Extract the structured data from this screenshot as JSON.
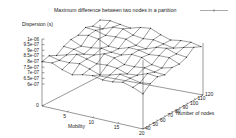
{
  "chart_data": {
    "type": "surface3d",
    "title": "",
    "legend": [
      {
        "label": "Maximum difference between two nodes in a partition",
        "style": "line-with-points",
        "color": "#000000"
      }
    ],
    "zlabel": "Dispersion (s)",
    "xlabel": "Mobility",
    "ylabel": "Number of nodes",
    "x_ticks": [
      "0",
      "5",
      "10",
      "15",
      "20"
    ],
    "y_ticks": [
      "40",
      "50",
      "60",
      "70",
      "80",
      "90",
      "100",
      "110",
      "120"
    ],
    "z_ticks": [
      "1e-06",
      "9.5e-07",
      "9e-07",
      "8.5e-07",
      "8e-07",
      "7.5e-07",
      "7e-07",
      "6.5e-07",
      "6e-07"
    ],
    "xlim": [
      0,
      20
    ],
    "ylim": [
      40,
      120
    ],
    "zlim": [
      6e-07,
      1e-06
    ],
    "grid": false,
    "legend_position": "top-right",
    "surface_description": "Wireframe mesh roughly flat between ~8.5e-07 and ~9.5e-07 across all mobility (0-20) and node counts (40-120), with small fluctuations",
    "z_values_approx": [
      [
        8.6e-07,
        8.8e-07,
        8.9e-07,
        9e-07,
        9.1e-07,
        9.2e-07,
        9.3e-07,
        9.3e-07,
        9.4e-07
      ],
      [
        8.7e-07,
        8.8e-07,
        8.9e-07,
        9e-07,
        9.1e-07,
        9.2e-07,
        9.3e-07,
        9.4e-07,
        9.4e-07
      ],
      [
        8.7e-07,
        8.9e-07,
        9e-07,
        9e-07,
        9.1e-07,
        9.2e-07,
        9.3e-07,
        9.3e-07,
        9.4e-07
      ],
      [
        8.8e-07,
        8.9e-07,
        9e-07,
        9.1e-07,
        9.1e-07,
        9.2e-07,
        9.3e-07,
        9.4e-07,
        9.4e-07
      ],
      [
        8.8e-07,
        8.9e-07,
        9e-07,
        9.1e-07,
        9.2e-07,
        9.2e-07,
        9.3e-07,
        9.4e-07,
        9.5e-07
      ]
    ]
  },
  "labels": {
    "legend": "Maximum difference between two nodes in a partition",
    "zaxis": "Dispersion (s)",
    "xaxis": "Mobility",
    "yaxis": "Number of nodes"
  },
  "ticks": {
    "z": [
      "1e-06",
      "9.5e-07",
      "9e-07",
      "8.5e-07",
      "8e-07",
      "7.5e-07",
      "7e-07",
      "6.5e-07",
      "6e-07"
    ],
    "x": [
      "0",
      "5",
      "10",
      "15",
      "20"
    ],
    "y": [
      "40",
      "50",
      "60",
      "70",
      "80",
      "90",
      "100",
      "110",
      "120"
    ]
  }
}
